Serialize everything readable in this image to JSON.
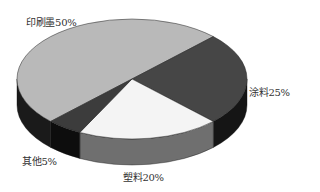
{
  "chart_data": {
    "type": "pie",
    "style": "3d-exploded-free",
    "title": "",
    "categories": [
      "印刷墨",
      "涂料",
      "塑料",
      "其他"
    ],
    "values": [
      50,
      25,
      20,
      5
    ],
    "unit": "%",
    "labels": [
      "印刷墨50%",
      "涂料25%",
      "塑料20%",
      "其他5%"
    ],
    "legend": "none",
    "colors": {
      "印刷墨": {
        "top": "#b9b9b9",
        "side": "#1a1a1a"
      },
      "涂料": {
        "top": "#464646",
        "side": "#151515"
      },
      "塑料": {
        "top": "#f4f4f4",
        "side": "#6f6f6f"
      },
      "其他": {
        "top": "#3c3c3c",
        "side": "#0d0d0d"
      }
    }
  }
}
